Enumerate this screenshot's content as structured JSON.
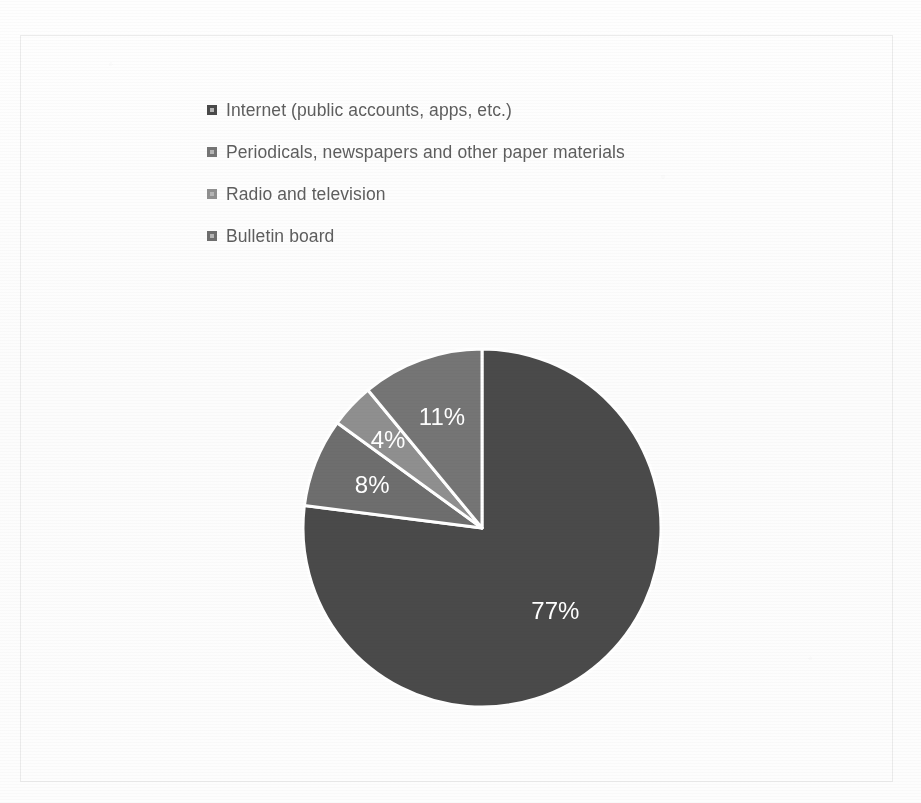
{
  "document": {
    "ghost_text_fragment": "",
    "frame_border_color": "#ebebeb",
    "background_color": "#fdfdfd"
  },
  "legend": {
    "marker_icon": "square-marker-icon",
    "items": [
      {
        "label": "Internet (public accounts, apps, etc.)",
        "color": "#4a4a4a"
      },
      {
        "label": "Periodicals, newspapers and other paper materials",
        "color": "#757575"
      },
      {
        "label": "Radio and television",
        "color": "#8f8f8f"
      },
      {
        "label": "Bulletin board",
        "color": "#6e6e6e"
      }
    ]
  },
  "chart_data": {
    "type": "pie",
    "title": "",
    "subtitle": "",
    "xlabel": "",
    "ylabel": "",
    "legend_position": "top-left",
    "grid": false,
    "start_angle_deg": 0,
    "direction": "clockwise",
    "categories": [
      "Internet (public accounts, apps, etc.)",
      "Periodicals, newspapers and other paper materials",
      "Radio and television",
      "Bulletin board"
    ],
    "values": [
      77,
      8,
      4,
      11
    ],
    "labels": [
      "77%",
      "8%",
      "4%",
      "11%"
    ],
    "colors": [
      "#4a4a4a",
      "#6e6e6e",
      "#8f8f8f",
      "#757575"
    ],
    "slice_separator_color": "#ffffff",
    "data_label_color": "#ffffff",
    "slices": [
      {
        "name": "Internet (public accounts, apps, etc.)",
        "value": 77,
        "label": "77%",
        "color": "#4a4a4a"
      },
      {
        "name": "Periodicals, newspapers and other paper materials",
        "value": 8,
        "label": "8%",
        "color": "#6e6e6e"
      },
      {
        "name": "Radio and television",
        "value": 4,
        "label": "4%",
        "color": "#8f8f8f"
      },
      {
        "name": "Bulletin board",
        "value": 11,
        "label": "11%",
        "color": "#757575"
      }
    ],
    "total": 100
  },
  "pie_labels": {
    "s77": "77%",
    "s8": "8%",
    "s4": "4%",
    "s11": "11%"
  }
}
